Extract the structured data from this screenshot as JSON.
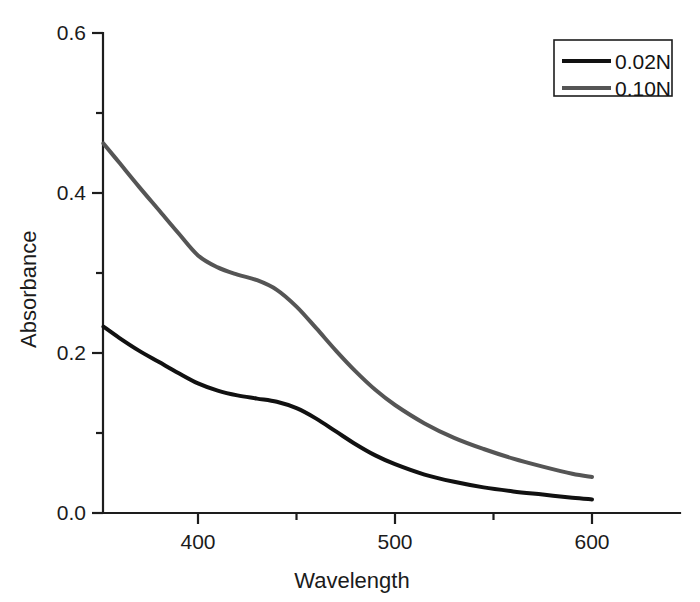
{
  "chart_data": {
    "type": "line",
    "title": "",
    "xlabel": "Wavelength",
    "ylabel": "Absorbance",
    "xlim": [
      352,
      612
    ],
    "ylim": [
      0.0,
      0.6
    ],
    "grid": false,
    "legend_position": "top-right",
    "x_ticks": [
      400,
      500,
      600
    ],
    "x_tick_labels": [
      "400",
      "500",
      "600"
    ],
    "x_minor_ticks": [
      350,
      450,
      550
    ],
    "y_ticks": [
      0.0,
      0.2,
      0.4,
      0.6
    ],
    "y_tick_labels": [
      "0.0",
      "0.2",
      "0.4",
      "0.6"
    ],
    "y_minor_ticks": [
      0.1,
      0.3,
      0.5
    ],
    "series": [
      {
        "name": "0.02N",
        "color": "#111111",
        "width": 4.0,
        "x": [
          352,
          360,
          370,
          380,
          390,
          400,
          410,
          420,
          430,
          440,
          450,
          460,
          470,
          480,
          490,
          500,
          515,
          530,
          545,
          560,
          575,
          590,
          600
        ],
        "values": [
          0.233,
          0.219,
          0.203,
          0.189,
          0.175,
          0.162,
          0.153,
          0.147,
          0.143,
          0.139,
          0.131,
          0.118,
          0.102,
          0.086,
          0.072,
          0.061,
          0.048,
          0.039,
          0.032,
          0.027,
          0.023,
          0.019,
          0.017
        ]
      },
      {
        "name": "0.10N",
        "color": "#555555",
        "width": 4.0,
        "x": [
          352,
          360,
          370,
          380,
          390,
          400,
          410,
          420,
          430,
          440,
          450,
          460,
          470,
          480,
          490,
          500,
          515,
          530,
          545,
          560,
          575,
          590,
          600
        ],
        "values": [
          0.462,
          0.438,
          0.408,
          0.379,
          0.35,
          0.322,
          0.307,
          0.298,
          0.291,
          0.279,
          0.258,
          0.231,
          0.203,
          0.177,
          0.154,
          0.135,
          0.112,
          0.094,
          0.08,
          0.068,
          0.058,
          0.049,
          0.045
        ]
      }
    ]
  },
  "legend": {
    "entries": [
      {
        "label": "0.02N",
        "color": "#111111"
      },
      {
        "label": "0.10N",
        "color": "#555555"
      }
    ]
  }
}
